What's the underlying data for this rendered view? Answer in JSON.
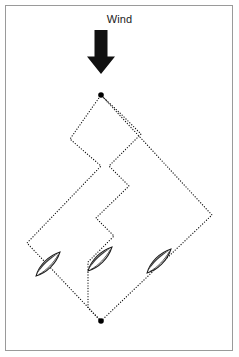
{
  "figure": {
    "background_color": "#ffffff",
    "frame_color": "#9a9a9a",
    "line_color": "#1a1a1a",
    "marker_color": "#000000",
    "boat_hull_color": "#3a3a3a",
    "boat_outline_color": "#1a1a1a",
    "width": 239,
    "height": 357
  },
  "wind": {
    "label": "Wind",
    "direction": "downward",
    "arrow_color": "#111111",
    "arrow_x": 101,
    "arrow_top": 30,
    "arrow_bottom": 74
  },
  "marks": {
    "windward_mark": {
      "label": "windward mark",
      "x": 101,
      "y": 95
    },
    "leeward_mark": {
      "label": "leeward mark",
      "x": 101,
      "y": 321
    }
  },
  "routes": [
    {
      "name": "left-route",
      "style": "dotted",
      "description": "single long port tack out to the left layline then one tack to the mark",
      "points": [
        [
          101,
          321
        ],
        [
          27,
          243
        ],
        [
          101,
          166
        ],
        [
          70,
          139
        ],
        [
          101,
          95
        ]
      ]
    },
    {
      "name": "zigzag-route",
      "style": "dotted",
      "description": "many short tacks up the middle of the course",
      "points": [
        [
          101,
          321
        ],
        [
          88,
          308
        ],
        [
          88,
          262
        ],
        [
          114,
          236
        ],
        [
          96,
          218
        ],
        [
          129,
          186
        ],
        [
          109,
          166
        ],
        [
          141,
          134
        ],
        [
          122,
          115
        ],
        [
          101,
          95
        ]
      ]
    },
    {
      "name": "right-route",
      "style": "dotted",
      "description": "single long starboard tack out to the right layline then one tack to the mark",
      "points": [
        [
          101,
          321
        ],
        [
          212,
          215
        ],
        [
          101,
          95
        ]
      ]
    }
  ],
  "boats": [
    {
      "name": "boat-left",
      "x": 48,
      "y": 264,
      "rotation_deg": 45,
      "length": 34,
      "beam": 11
    },
    {
      "name": "boat-middle",
      "x": 100,
      "y": 259,
      "rotation_deg": 45,
      "length": 34,
      "beam": 11
    },
    {
      "name": "boat-right",
      "x": 159,
      "y": 261,
      "rotation_deg": 45,
      "length": 34,
      "beam": 11
    }
  ]
}
